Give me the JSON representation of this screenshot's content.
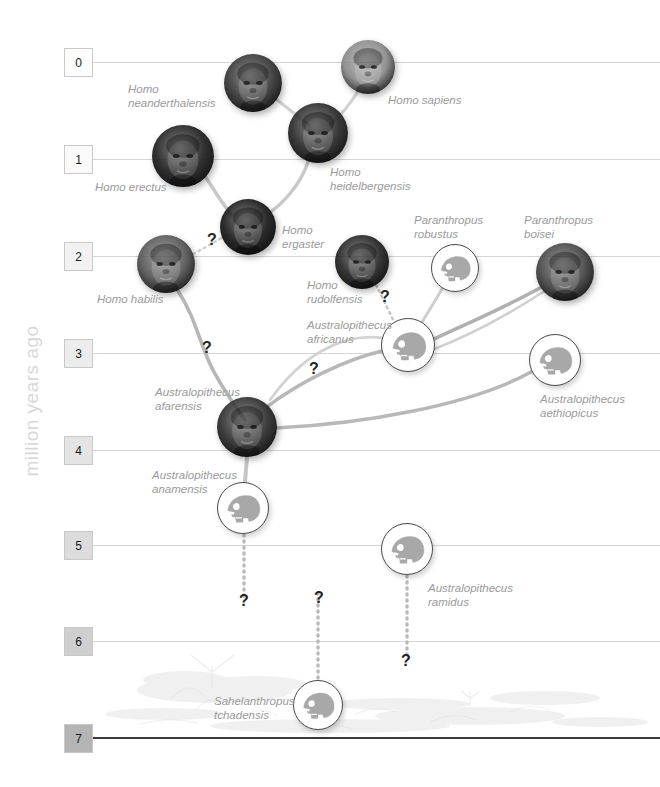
{
  "axis": {
    "caption": "million years ago",
    "ticks": [
      {
        "label": "0",
        "y": 62,
        "box_fill": "#fdfdfd"
      },
      {
        "label": "1",
        "y": 159,
        "box_fill": "#fafafa"
      },
      {
        "label": "2",
        "y": 256,
        "box_fill": "#f2f2f2"
      },
      {
        "label": "3",
        "y": 353,
        "box_fill": "#ececec"
      },
      {
        "label": "4",
        "y": 450,
        "box_fill": "#e4e4e4"
      },
      {
        "label": "5",
        "y": 545,
        "box_fill": "#dcdcdc"
      },
      {
        "label": "6",
        "y": 641,
        "box_fill": "#cfcfcf"
      },
      {
        "label": "7",
        "y": 738,
        "box_fill": "#b4b4b4"
      }
    ]
  },
  "colors": {
    "line": "#d5d5d5",
    "baseline": "#3a3a3a",
    "label_text": "#9a9a9a",
    "link": "#c0c0c0",
    "link_strong": "#a8a8a8",
    "skull_fill": "#a8a8a8",
    "skull_stroke": "#4a4a4a"
  },
  "nodes": [
    {
      "id": "neanderthalensis",
      "kind": "photo",
      "cx": 253,
      "cy": 83,
      "r": 29,
      "tone": "#3b3b3b",
      "label": "Homo\nneanderthalensis",
      "lx": 128,
      "ly": 82,
      "align": "left"
    },
    {
      "id": "sapiens",
      "kind": "photo",
      "cx": 368,
      "cy": 67,
      "r": 27,
      "tone": "#8d8d8d",
      "label": "Homo sapiens",
      "lx": 388,
      "ly": 93,
      "align": "right"
    },
    {
      "id": "heidelbergensis",
      "kind": "photo",
      "cx": 318,
      "cy": 133,
      "r": 30,
      "tone": "#2f2f2f",
      "label": "Homo\nheidelbergensis",
      "lx": 330,
      "ly": 165,
      "align": "right"
    },
    {
      "id": "erectus",
      "kind": "photo",
      "cx": 183,
      "cy": 156,
      "r": 31,
      "tone": "#262626",
      "label": "Homo erectus",
      "lx": 95,
      "ly": 180,
      "align": "left"
    },
    {
      "id": "ergaster",
      "kind": "photo",
      "cx": 248,
      "cy": 227,
      "r": 28,
      "tone": "#1f1f1f",
      "label": "Homo\nergaster",
      "lx": 282,
      "ly": 223,
      "align": "right"
    },
    {
      "id": "habilis",
      "kind": "photo",
      "cx": 166,
      "cy": 264,
      "r": 29,
      "tone": "#5a5a5a",
      "label": "Homo habilis",
      "lx": 97,
      "ly": 292,
      "align": "left"
    },
    {
      "id": "rudolfensis",
      "kind": "photo",
      "cx": 362,
      "cy": 262,
      "r": 27,
      "tone": "#2a2a2a",
      "label": "Homo\nrudolfensis",
      "lx": 307,
      "ly": 278,
      "align": "left"
    },
    {
      "id": "robustus",
      "kind": "skull",
      "cx": 455,
      "cy": 268,
      "r": 24,
      "label": "Paranthropus\nrobustus",
      "lx": 414,
      "ly": 213,
      "align": "right"
    },
    {
      "id": "boisei",
      "kind": "photo",
      "cx": 565,
      "cy": 272,
      "r": 29,
      "tone": "#4a4a4a",
      "label": "Paranthropus\nboisei",
      "lx": 524,
      "ly": 213,
      "align": "right"
    },
    {
      "id": "africanus",
      "kind": "skull",
      "cx": 408,
      "cy": 345,
      "r": 27,
      "label": "Australopithecus\nafricanus",
      "lx": 307,
      "ly": 318,
      "align": "left"
    },
    {
      "id": "aethiopicus",
      "kind": "skull",
      "cx": 555,
      "cy": 360,
      "r": 26,
      "label": "Australopithecus\naethiopicus",
      "lx": 540,
      "ly": 392,
      "align": "right"
    },
    {
      "id": "afarensis",
      "kind": "photo",
      "cx": 247,
      "cy": 427,
      "r": 30,
      "tone": "#333333",
      "label": "Australopithecus\nafarensis",
      "lx": 155,
      "ly": 385,
      "align": "left"
    },
    {
      "id": "anamensis",
      "kind": "skull",
      "cx": 243,
      "cy": 508,
      "r": 26,
      "label": "Australopithecus\nanamensis",
      "lx": 152,
      "ly": 468,
      "align": "left"
    },
    {
      "id": "ramidus",
      "kind": "skull",
      "cx": 407,
      "cy": 549,
      "r": 26,
      "label": "Australopithecus\nramidus",
      "lx": 428,
      "ly": 581,
      "align": "right"
    },
    {
      "id": "tchadensis",
      "kind": "skull",
      "cx": 318,
      "cy": 705,
      "r": 25,
      "label": "Sahelanthropus\ntchadensis",
      "lx": 214,
      "ly": 694,
      "align": "left"
    }
  ],
  "links": [
    {
      "from": "neanderthalensis",
      "to": "heidelbergensis",
      "d": "M 276,99 C 292,112 300,118 308,124",
      "w": 3.2,
      "tone": "#d2d2d2"
    },
    {
      "from": "sapiens",
      "to": "heidelbergensis",
      "d": "M 358,91 C 348,108 338,118 330,125",
      "w": 3.2,
      "tone": "#d2d2d2"
    },
    {
      "from": "heidelbergensis",
      "to": "ergaster",
      "d": "M 308,162 C 300,186 282,204 268,214",
      "w": 3.4,
      "tone": "#c8c8c8"
    },
    {
      "from": "erectus",
      "to": "ergaster",
      "d": "M 205,176 C 216,194 226,208 232,216",
      "w": 3.4,
      "tone": "#c8c8c8"
    },
    {
      "from": "habilis",
      "to": "afarensis",
      "d": "M 178,291 C 196,318 200,346 214,372 C 226,394 238,410 245,420",
      "w": 3.6,
      "tone": "#b6b6b6"
    },
    {
      "from": "habilis",
      "to": "ergaster",
      "d": "M 193,254 C 208,246 218,240 226,235",
      "w": 2.4,
      "tone": "#cfcfcf",
      "dash": "2 4"
    },
    {
      "from": "rudolfensis",
      "to": "africanus",
      "d": "M 376,285 C 384,300 392,318 398,330",
      "w": 2.4,
      "tone": "#c3c3c3",
      "dash": "2 4"
    },
    {
      "from": "robustus",
      "to": "africanus",
      "d": "M 442,289 C 432,306 422,322 416,332",
      "w": 3.0,
      "tone": "#cfcfcf"
    },
    {
      "from": "boisei",
      "to": "africanus",
      "d": "M 540,288 C 492,314 452,330 428,342",
      "w": 3.6,
      "tone": "#b0b0b0"
    },
    {
      "from": "boisei",
      "to": "aethiopicus",
      "d": "M 543,292 C 500,320 468,336 432,350",
      "w": 2.6,
      "tone": "#d0d0d0"
    },
    {
      "from": "africanus",
      "to": "afarensis",
      "d": "M 382,351 C 344,360 300,382 268,406",
      "w": 3.4,
      "tone": "#b8b8b8"
    },
    {
      "from": "aethiopicus",
      "to": "afarensis",
      "d": "M 531,372 C 470,406 360,424 276,428",
      "w": 3.4,
      "tone": "#b8b8b8"
    },
    {
      "from": "africanus",
      "to": "afarensis2",
      "d": "M 383,338 C 340,332 300,358 270,400",
      "w": 2.6,
      "tone": "#d2d2d2"
    },
    {
      "from": "afarensis",
      "to": "anamensis",
      "d": "M 247,457 L 245,482",
      "w": 4.0,
      "tone": "#c6c6c6"
    },
    {
      "from": "anamensis",
      "to": "gap1",
      "d": "M 244,535 L 244,596",
      "w": 3.4,
      "tone": "#b9b9b9",
      "dash": "1 5"
    },
    {
      "from": "ramidus",
      "to": "gap2",
      "d": "M 407,576 L 407,660",
      "w": 3.4,
      "tone": "#b9b9b9",
      "dash": "1 5"
    },
    {
      "from": "tchadensis",
      "to": "gap3",
      "d": "M 318,678 L 318,590",
      "w": 3.4,
      "tone": "#b9b9b9",
      "dash": "1 5"
    }
  ],
  "questions": [
    {
      "x": 212,
      "y": 240
    },
    {
      "x": 385,
      "y": 297
    },
    {
      "x": 207,
      "y": 348
    },
    {
      "x": 314,
      "y": 369
    },
    {
      "x": 244,
      "y": 601
    },
    {
      "x": 319,
      "y": 598
    },
    {
      "x": 406,
      "y": 661
    }
  ],
  "icons": {
    "skull": "skull-profile-icon",
    "face": "hominid-face-photo"
  }
}
